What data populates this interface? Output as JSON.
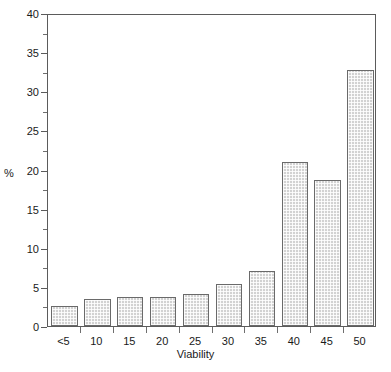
{
  "chart_data": {
    "type": "bar",
    "title": "",
    "subtitle": "",
    "xlabel": "Viability",
    "ylabel": "%",
    "categories": [
      "<5",
      "10",
      "15",
      "20",
      "25",
      "30",
      "35",
      "40",
      "45",
      "50"
    ],
    "values": [
      2.5,
      3.4,
      3.7,
      3.7,
      4.1,
      5.4,
      7.0,
      21.0,
      18.7,
      32.7
    ],
    "series": [
      {
        "name": "%",
        "values": [
          2.5,
          3.4,
          3.7,
          3.7,
          4.1,
          5.4,
          7.0,
          21.0,
          18.7,
          32.7
        ]
      }
    ],
    "ylim": [
      0,
      40
    ],
    "y_major_ticks": [
      0,
      5,
      10,
      15,
      20,
      25,
      30,
      35,
      40
    ],
    "y_minor_ticks": [
      2.5,
      7.5,
      12.5,
      17.5,
      22.5,
      27.5,
      32.5,
      37.5
    ],
    "y_tick_labels": [
      "0",
      "5",
      "10",
      "15",
      "20",
      "25",
      "30",
      "35",
      "40"
    ],
    "x_tick_labels": [
      "<5",
      "10",
      "15",
      "20",
      "25",
      "30",
      "35",
      "40",
      "45",
      "50"
    ],
    "grid": false,
    "legend": false,
    "legend_position": "none",
    "bar_fill_color": "#d2d2d2",
    "bar_edge_color": "#6a6a6a",
    "frame_color": "#5b5b5b",
    "background_color": "#ffffff",
    "annotations": []
  }
}
